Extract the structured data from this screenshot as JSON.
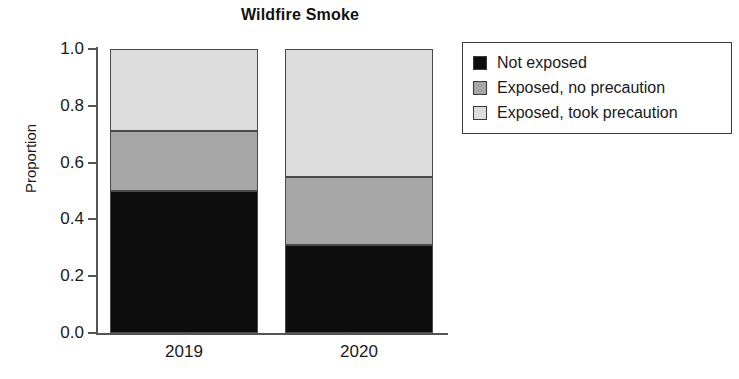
{
  "chart_data": {
    "type": "bar",
    "subtype": "stacked-bar",
    "title": "Wildfire Smoke",
    "xlabel": "",
    "ylabel": "Proportion",
    "categories": [
      "2019",
      "2020"
    ],
    "ylim": [
      0.0,
      1.0
    ],
    "ytick_labels": [
      "1.0",
      "0.8",
      "0.6",
      "0.4",
      "0.2",
      "0.0"
    ],
    "ytick_values": [
      1.0,
      0.8,
      0.6,
      0.4,
      0.2,
      0.0
    ],
    "grid": false,
    "legend_position": "upper right (outside plot)",
    "series": [
      {
        "name": "Not exposed",
        "color": "#0d0d0d",
        "values": [
          0.5,
          0.31
        ]
      },
      {
        "name": "Exposed, no precaution",
        "color": "#a6a6a6",
        "values": [
          0.21,
          0.24
        ]
      },
      {
        "name": "Exposed, took precaution",
        "color": "#dcdcdc",
        "values": [
          0.29,
          0.45
        ]
      }
    ],
    "cumulative_tops": {
      "2019": {
        "not_exposed": 0.5,
        "exposed_no_precaution": 0.71,
        "exposed_took_precaution": 1.0
      },
      "2020": {
        "not_exposed": 0.31,
        "exposed_no_precaution": 0.55,
        "exposed_took_precaution": 1.0
      }
    }
  },
  "axes": {
    "y_title": "Proportion",
    "y_ticks": [
      {
        "label": "1.0",
        "value": 1.0
      },
      {
        "label": "0.8",
        "value": 0.8
      },
      {
        "label": "0.6",
        "value": 0.6
      },
      {
        "label": "0.4",
        "value": 0.4
      },
      {
        "label": "0.2",
        "value": 0.2
      },
      {
        "label": "0.0",
        "value": 0.0
      }
    ],
    "x_ticks": [
      {
        "label": "2019"
      },
      {
        "label": "2020"
      }
    ]
  },
  "legend": {
    "entries": [
      {
        "label": "Not exposed",
        "color": "#0d0d0d"
      },
      {
        "label": "Exposed, no precaution",
        "color": "#a6a6a6"
      },
      {
        "label": "Exposed, took precaution",
        "color": "#dcdcdc"
      }
    ]
  },
  "title": "Wildfire Smoke"
}
